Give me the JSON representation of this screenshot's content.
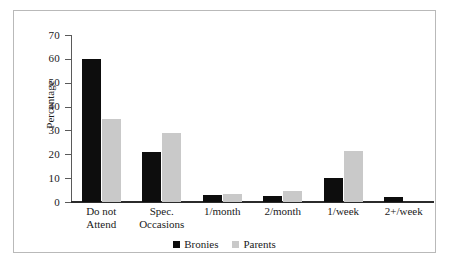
{
  "chart_data": {
    "type": "bar",
    "title": "",
    "xlabel": "",
    "ylabel": "Percentage",
    "ylim": [
      0,
      70
    ],
    "yticks": [
      0,
      10,
      20,
      30,
      40,
      50,
      60,
      70
    ],
    "ytick_labels": [
      "0",
      "10",
      "20",
      "30",
      "40",
      "50",
      "60",
      "70"
    ],
    "grid": false,
    "legend_position": "bottom-center",
    "categories": [
      "Do not\nAttend",
      "Spec.\nOccasions",
      "1/month",
      "2/month",
      "1/week",
      "2+/week"
    ],
    "series": [
      {
        "name": "Bronies",
        "color": "#0d0d0d",
        "values": [
          60,
          21,
          3,
          2.5,
          10,
          2
        ]
      },
      {
        "name": "Parents",
        "color": "#c9c9c9",
        "values": [
          35,
          29,
          3.5,
          4.5,
          21.5,
          0
        ]
      }
    ]
  },
  "legend": {
    "entries": [
      {
        "label": "Bronies",
        "swatch": "black-square-icon"
      },
      {
        "label": "Parents",
        "swatch": "gray-square-icon"
      }
    ]
  },
  "colors": {
    "bronies": "#0d0d0d",
    "parents": "#c9c9c9",
    "axis": "#2b2b2b",
    "frame": "#b9b9b9",
    "background": "#ffffff"
  }
}
